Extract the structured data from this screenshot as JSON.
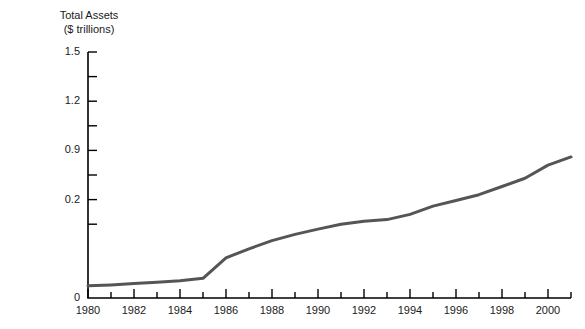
{
  "chart_data": {
    "type": "line",
    "title": "",
    "ylabel_line1": "Total Assets",
    "ylabel_line2": "($ trillions)",
    "xlabel": "",
    "grid": false,
    "legend": false,
    "line_color": "#555555",
    "axis_color": "#000000",
    "background": "#ffffff",
    "xlim": [
      1980,
      2001
    ],
    "ylim": [
      0,
      1.5
    ],
    "y_tick_labels": [
      "1.5",
      "1.2",
      "0.9",
      "0.2",
      "0"
    ],
    "y_tick_values": [
      1.5,
      1.2,
      0.9,
      0.6,
      0.0
    ],
    "y_minor_ticks": [
      1.35,
      1.05,
      0.75,
      0.45
    ],
    "x_tick_labels": [
      "1980",
      "1982",
      "1984",
      "1986",
      "1988",
      "1990",
      "1992",
      "1994",
      "1996",
      "1998",
      "2000"
    ],
    "x_tick_values": [
      1980,
      1982,
      1984,
      1986,
      1988,
      1990,
      1992,
      1994,
      1996,
      1998,
      2000
    ],
    "x_minor_ticks": [
      1981,
      1983,
      1985,
      1987,
      1989,
      1991,
      1993,
      1995,
      1997,
      1999,
      2001
    ],
    "series": [
      {
        "name": "Total Assets",
        "x": [
          1980,
          1981,
          1982,
          1983,
          1984,
          1985,
          1986,
          1987,
          1988,
          1989,
          1990,
          1991,
          1992,
          1993,
          1994,
          1995,
          1996,
          1997,
          1998,
          1999,
          2000,
          2001
        ],
        "values": [
          0.075,
          0.08,
          0.088,
          0.096,
          0.105,
          0.12,
          0.245,
          0.3,
          0.35,
          0.388,
          0.42,
          0.45,
          0.468,
          0.478,
          0.51,
          0.56,
          0.595,
          0.63,
          0.68,
          0.73,
          0.81,
          0.86
        ]
      }
    ]
  }
}
